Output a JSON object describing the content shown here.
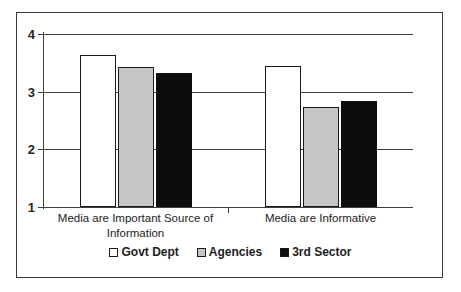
{
  "chart_data": {
    "type": "bar",
    "title": "",
    "xlabel": "",
    "ylabel": "",
    "ylim": [
      1,
      4
    ],
    "yticks": [
      1,
      2,
      3,
      4
    ],
    "ytick_labels": [
      "1",
      "2",
      "3",
      "4"
    ],
    "grid": true,
    "legend_position": "bottom",
    "categories": [
      "Media are Important Source of Information",
      "Media are Informative"
    ],
    "category_lines": [
      [
        "Media are Important Source of",
        "Information"
      ],
      [
        "Media are Informative"
      ]
    ],
    "series": [
      {
        "name": "Govt Dept",
        "color": "#ffffff",
        "values": [
          3.63,
          3.45
        ]
      },
      {
        "name": "Agencies",
        "color": "#c6c6c6",
        "values": [
          3.43,
          2.73
        ]
      },
      {
        "name": "3rd Sector",
        "color": "#0d0d0d",
        "values": [
          3.33,
          2.83
        ]
      }
    ]
  },
  "legend": {
    "items": [
      {
        "label": "Govt Dept",
        "swatch": "white"
      },
      {
        "label": "Agencies",
        "swatch": "gray"
      },
      {
        "label": "3rd Sector",
        "swatch": "black"
      }
    ]
  },
  "axis": {
    "ytick_labels": [
      "4",
      "3",
      "2",
      "1"
    ]
  }
}
